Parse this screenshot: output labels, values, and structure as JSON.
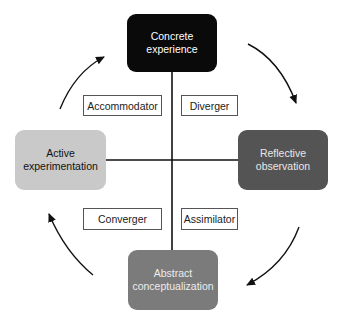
{
  "diagram": {
    "type": "cycle",
    "center_axes": {
      "vertical_x": 172,
      "horizontal_y": 160
    },
    "stages": [
      {
        "id": "concrete",
        "label_line1": "Concrete",
        "label_line2": "experience",
        "fill": "#0a0a0a",
        "text_color": "#ffffff",
        "position": "top"
      },
      {
        "id": "reflective",
        "label_line1": "Reflective",
        "label_line2": "observation",
        "fill": "#545454",
        "text_color": "#e8e8e8",
        "position": "right"
      },
      {
        "id": "abstract",
        "label_line1": "Abstract",
        "label_line2": "conceptualization",
        "fill": "#7b7b7b",
        "text_color": "#ececec",
        "position": "bottom"
      },
      {
        "id": "active",
        "label_line1": "Active",
        "label_line2": "experimentation",
        "fill": "#c9c9c9",
        "text_color": "#111111",
        "position": "left"
      }
    ],
    "styles": [
      {
        "label": "Accommodator",
        "quadrant": "top-left"
      },
      {
        "label": "Diverger",
        "quadrant": "top-right"
      },
      {
        "label": "Converger",
        "quadrant": "bottom-left"
      },
      {
        "label": "Assimilator",
        "quadrant": "bottom-right"
      }
    ],
    "arrows": [
      {
        "from": "concrete",
        "to": "reflective",
        "direction": "clockwise"
      },
      {
        "from": "reflective",
        "to": "abstract",
        "direction": "clockwise"
      },
      {
        "from": "abstract",
        "to": "active",
        "direction": "clockwise"
      },
      {
        "from": "active",
        "to": "concrete",
        "direction": "clockwise"
      }
    ],
    "colors": {
      "line": "#111111",
      "box_border": "#555555",
      "background": "#ffffff"
    }
  }
}
